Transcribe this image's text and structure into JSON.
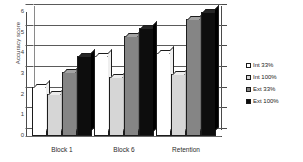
{
  "chart_data": {
    "type": "bar",
    "title": "",
    "xlabel": "",
    "ylabel": "Accuracy score",
    "ylim": [
      0,
      6
    ],
    "yticks": [
      "0",
      "1",
      "2",
      "3",
      "4",
      "5",
      "6"
    ],
    "grid": true,
    "legend_position": "right",
    "style": "3d-grouped-column",
    "categories": [
      "Block 1",
      "Block 6",
      "Retention"
    ],
    "series": [
      {
        "name": "Int 33%",
        "color": "#ffffff",
        "values": [
          2.35,
          3.85,
          4.0
        ]
      },
      {
        "name": "Int 100%",
        "color": "#d6d6d6",
        "values": [
          2.05,
          2.85,
          3.0
        ]
      },
      {
        "name": "Ext 33%",
        "color": "#858585",
        "values": [
          3.1,
          4.85,
          5.65
        ]
      },
      {
        "name": "Ext 100%",
        "color": "#0d0d0d",
        "values": [
          3.85,
          5.25,
          6.0
        ]
      }
    ]
  },
  "axis": {
    "y_title": "Accuracy score"
  },
  "legend": {
    "items": [
      {
        "label": "Int 33%"
      },
      {
        "label": "Int 100%"
      },
      {
        "label": "Ext 33%"
      },
      {
        "label": "Ext 100%"
      }
    ]
  }
}
